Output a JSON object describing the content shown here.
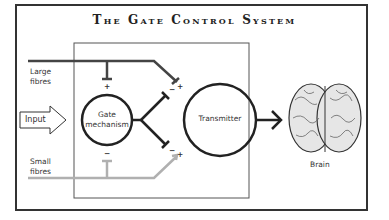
{
  "title": "The Gate Control System",
  "labels": {
    "large_fibres_1": "Large",
    "large_fibres_2": "fibres",
    "small_fibres_1": "Small",
    "small_fibres_2": "fibres",
    "input": "Input",
    "gate_1": "Gate",
    "gate_2": "mechanism",
    "transmitter": "Transmitter",
    "brain": "Brain"
  },
  "signs": {
    "gate_top": "+",
    "gate_bottom": "−",
    "trans_top_minus": "−",
    "trans_top_plus": "+",
    "trans_bottom_minus": "−",
    "trans_bottom_plus": "+"
  },
  "colors": {
    "large_fibre": "#444444",
    "small_fibre": "#b0b0b0",
    "outline": "#222222"
  }
}
